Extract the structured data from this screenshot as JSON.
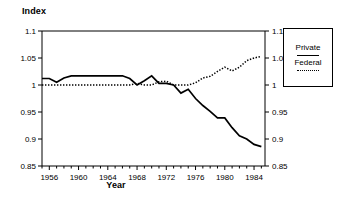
{
  "chart_data": {
    "type": "line",
    "title": "",
    "ylabel": "Index",
    "xlabel": "Year",
    "ylim": [
      0.85,
      1.1
    ],
    "xlim": [
      1955,
      1985.5
    ],
    "grid": false,
    "y_ticks": [
      "0.85",
      "0.9",
      "0.95",
      "1",
      "1.05",
      "1.1"
    ],
    "y_tick_values": [
      0.85,
      0.9,
      0.95,
      1.0,
      1.05,
      1.1
    ],
    "y_axis_both_sides": true,
    "x_ticks": [
      "1956",
      "1960",
      "1964",
      "1968",
      "1972",
      "1976",
      "1980",
      "1984"
    ],
    "x_tick_values": [
      1956,
      1960,
      1964,
      1968,
      1972,
      1976,
      1980,
      1984
    ],
    "x_minor_interval": 1,
    "legend_position": "right-outside",
    "x": [
      1955,
      1956,
      1957,
      1958,
      1959,
      1960,
      1961,
      1962,
      1963,
      1964,
      1965,
      1966,
      1967,
      1968,
      1969,
      1970,
      1971,
      1972,
      1973,
      1974,
      1975,
      1976,
      1977,
      1978,
      1979,
      1980,
      1981,
      1982,
      1983,
      1984,
      1985
    ],
    "series": [
      {
        "name": "Private",
        "style": "solid",
        "color": "#000000",
        "values": [
          1.012,
          1.012,
          1.005,
          1.013,
          1.017,
          1.017,
          1.017,
          1.017,
          1.017,
          1.017,
          1.017,
          1.017,
          1.012,
          1.0,
          1.008,
          1.017,
          1.003,
          1.003,
          1.0,
          0.985,
          0.992,
          0.975,
          0.962,
          0.951,
          0.939,
          0.939,
          0.921,
          0.906,
          0.9,
          0.89,
          0.886
        ]
      },
      {
        "name": "Federal",
        "style": "dotted",
        "color": "#000000",
        "values": [
          1.0,
          1.0,
          1.0,
          1.0,
          1.0,
          1.0,
          1.0,
          1.0,
          1.0,
          1.0,
          1.0,
          1.0,
          1.0,
          1.003,
          1.0,
          1.0,
          1.006,
          1.007,
          1.0,
          1.0,
          1.0,
          1.004,
          1.013,
          1.016,
          1.025,
          1.033,
          1.026,
          1.033,
          1.045,
          1.05,
          1.053
        ]
      }
    ]
  },
  "legend": {
    "entries": [
      {
        "label": "Private",
        "style": "solid"
      },
      {
        "label": "Federal",
        "style": "dotted"
      }
    ]
  }
}
